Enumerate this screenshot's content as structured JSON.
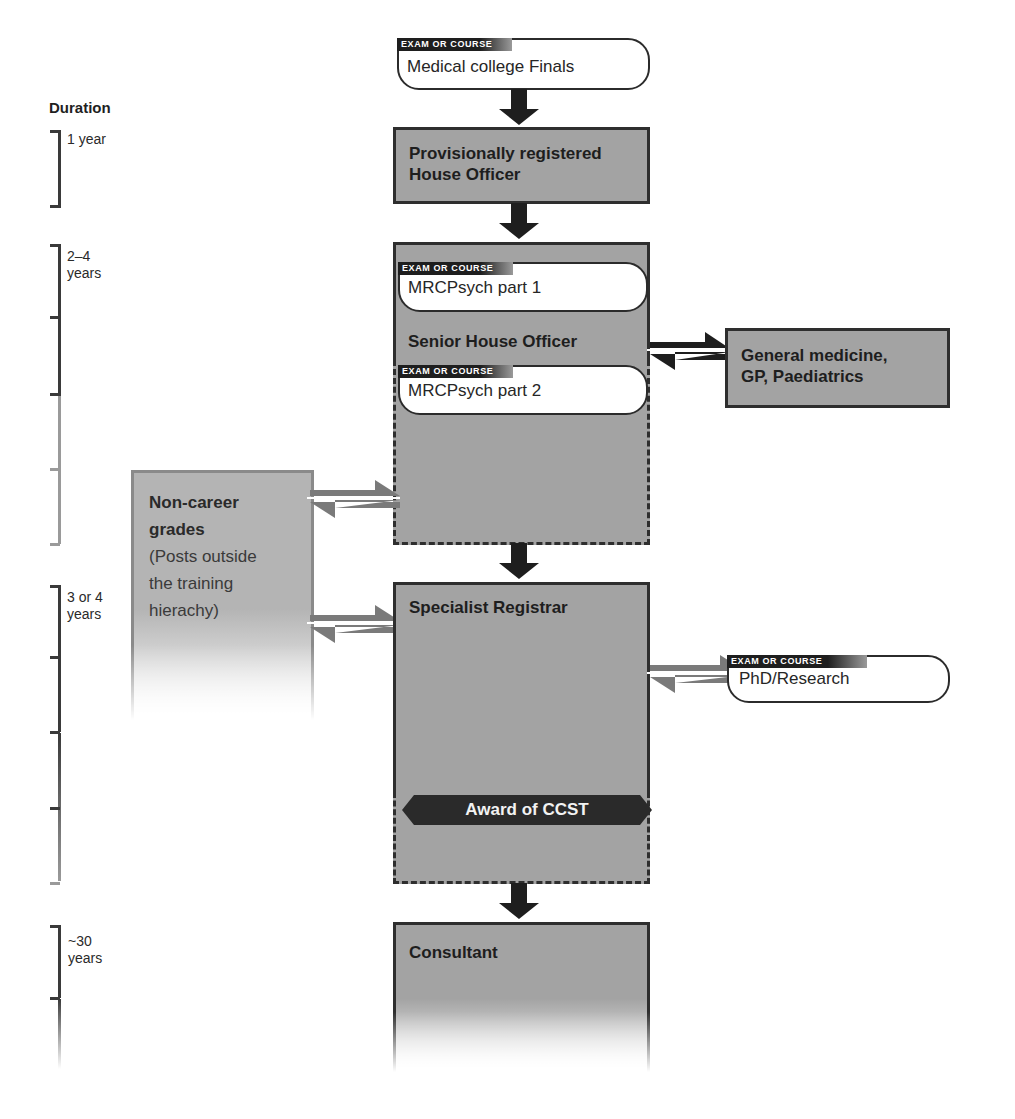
{
  "duration": {
    "title": "Duration",
    "periods": [
      {
        "label": "1 year"
      },
      {
        "label_line1": "2–4",
        "label_line2": "years"
      },
      {
        "label_line1": "3 or 4",
        "label_line2": "years"
      },
      {
        "label_line1": "~30",
        "label_line2": "years"
      }
    ]
  },
  "exam_tag": "EXAM OR COURSE",
  "nodes": {
    "finals": {
      "text": "Medical college Finals"
    },
    "house_officer": {
      "line1": "Provisionally registered",
      "line2": "House Officer"
    },
    "sho": {
      "title": "Senior House Officer"
    },
    "mrcpsych1": {
      "text": "MRCPsych part 1"
    },
    "mrcpsych2": {
      "text": "MRCPsych part 2"
    },
    "general_medicine": {
      "line1": "General medicine,",
      "line2": "GP, Paediatrics"
    },
    "non_career": {
      "line1": "Non-career",
      "line2": "grades",
      "sub1": "(Posts outside",
      "sub2": "the training",
      "sub3": "hierachy)"
    },
    "specialist_registrar": {
      "title": "Specialist Registrar"
    },
    "phd": {
      "text": "PhD/Research"
    },
    "ccst": {
      "text": "Award of CCST"
    },
    "consultant": {
      "title": "Consultant"
    }
  },
  "colors": {
    "box_fill": "#a3a3a3",
    "box_border": "#2e2e2e",
    "arrow_dark": "#1e1e1e",
    "arrow_light": "#7a7a7a",
    "pill_tag": "#1e1e1e"
  }
}
